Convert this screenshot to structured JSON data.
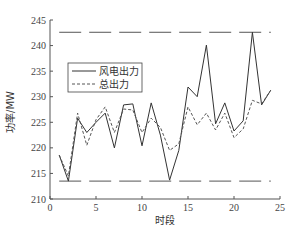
{
  "chart_data": {
    "type": "line",
    "title": "",
    "xlabel": "时段",
    "ylabel": "功率/MW",
    "xlim": [
      0,
      25
    ],
    "ylim": [
      210,
      245
    ],
    "xticks": [
      0,
      5,
      10,
      15,
      20,
      25
    ],
    "yticks": [
      210,
      215,
      220,
      225,
      230,
      235,
      240,
      245
    ],
    "grid": false,
    "legend_position": "upper-left (inside)",
    "x": [
      1,
      2,
      3,
      4,
      5,
      6,
      7,
      8,
      9,
      10,
      11,
      12,
      13,
      14,
      15,
      16,
      17,
      18,
      19,
      20,
      21,
      22,
      23,
      24
    ],
    "series": [
      {
        "name": "风电出力",
        "style": "solid",
        "color": "#333333",
        "values": [
          218.6,
          213.5,
          225.8,
          223.0,
          225.0,
          226.8,
          220.0,
          228.4,
          228.6,
          220.4,
          228.8,
          222.5,
          213.7,
          219.5,
          231.9,
          230.0,
          240.1,
          224.7,
          228.8,
          223.3,
          225.3,
          242.6,
          228.4,
          231.3
        ]
      },
      {
        "name": "总出力",
        "style": "dashed",
        "color": "#555555",
        "values": [
          218.6,
          214.5,
          226.8,
          220.5,
          225.5,
          228.0,
          223.0,
          227.6,
          227.4,
          223.0,
          225.8,
          224.0,
          219.5,
          220.8,
          228.0,
          224.5,
          226.8,
          223.5,
          226.8,
          222.0,
          223.7,
          229.3,
          228.6,
          231.3
        ]
      }
    ],
    "reference_lines": [
      {
        "name": "upper-limit",
        "value": 242.6,
        "x_range": [
          1,
          24
        ],
        "style": "long-dash"
      },
      {
        "name": "lower-limit",
        "value": 213.5,
        "x_range": [
          1,
          24
        ],
        "style": "long-dash"
      }
    ]
  },
  "legend": {
    "items": [
      {
        "label": "风电出力",
        "style": "solid"
      },
      {
        "label": "总出力",
        "style": "dashed"
      }
    ]
  }
}
